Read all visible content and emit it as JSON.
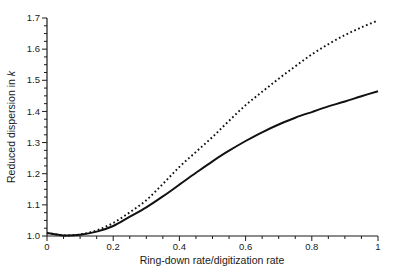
{
  "figure": {
    "background": "#ffffff",
    "axis_color": "#1a1a1a",
    "curve_color": "#111111"
  },
  "chart_data": {
    "type": "line",
    "title": "",
    "xlabel": "Ring-down rate/digitization rate",
    "ylabel": "Reduced dispersion in k",
    "ylabel_parts": {
      "text": "Reduced dispersion in ",
      "italic": "k"
    },
    "xlim": [
      0,
      1
    ],
    "ylim": [
      1.0,
      1.7
    ],
    "x_major_ticks": [
      0,
      0.2,
      0.4,
      0.6,
      0.8,
      1
    ],
    "x_tick_labels": [
      "0",
      "0.2",
      "0.4",
      "0.6",
      "0.8",
      "1"
    ],
    "x_minor_step": 0.05,
    "y_major_ticks": [
      1.0,
      1.1,
      1.2,
      1.3,
      1.4,
      1.5,
      1.6,
      1.7
    ],
    "y_tick_labels": [
      "1.0",
      "1.1",
      "1.2",
      "1.3",
      "1.4",
      "1.5",
      "1.6",
      "1.7"
    ],
    "y_minor_step": 0.025,
    "grid": false,
    "legend": "none",
    "x": [
      0,
      0.05,
      0.1,
      0.15,
      0.2,
      0.25,
      0.3,
      0.35,
      0.4,
      0.45,
      0.5,
      0.55,
      0.6,
      0.65,
      0.7,
      0.75,
      0.8,
      0.85,
      0.9,
      0.95,
      1
    ],
    "series": [
      {
        "name": "solid-curve",
        "line_style": "solid",
        "color": "#111111",
        "values": [
          1.01,
          1.002,
          1.004,
          1.014,
          1.032,
          1.062,
          1.092,
          1.127,
          1.165,
          1.203,
          1.24,
          1.274,
          1.305,
          1.333,
          1.358,
          1.38,
          1.398,
          1.416,
          1.432,
          1.449,
          1.465
        ]
      },
      {
        "name": "dotted-curve",
        "line_style": "dotted",
        "color": "#111111",
        "values": [
          1.01,
          1.002,
          1.005,
          1.018,
          1.042,
          1.076,
          1.115,
          1.167,
          1.222,
          1.27,
          1.318,
          1.37,
          1.42,
          1.463,
          1.505,
          1.545,
          1.583,
          1.616,
          1.645,
          1.67,
          1.692
        ]
      }
    ]
  }
}
